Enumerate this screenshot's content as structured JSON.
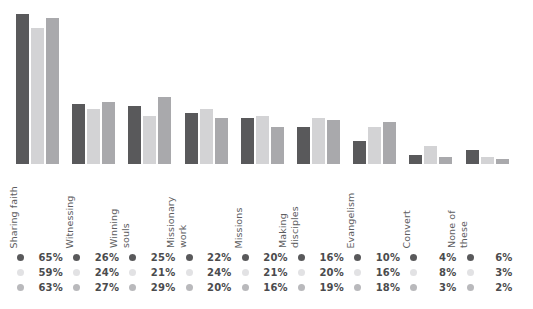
{
  "chart_data": {
    "type": "bar",
    "title": "",
    "subtitle": "",
    "xlabel": "",
    "ylabel": "",
    "grid": false,
    "legend_position": "bottom",
    "ylim": [
      0,
      70
    ],
    "value_suffix": "%",
    "orientation": "vertical",
    "grouping": "grouped",
    "categories": [
      "Sharing faith",
      "Witnessing",
      "Winning souls",
      "Missionary work",
      "Missions",
      "Making disciples",
      "Evangelism",
      "Convert",
      "None of these"
    ],
    "category_lines": [
      [
        "Sharing faith"
      ],
      [
        "Witnessing"
      ],
      [
        "Winning",
        "souls"
      ],
      [
        "Missionary",
        "work"
      ],
      [
        "Missions"
      ],
      [
        "Making",
        "disciples"
      ],
      [
        "Evangelism"
      ],
      [
        "Convert"
      ],
      [
        "None of",
        "these"
      ]
    ],
    "series": [
      {
        "name": "Series 1",
        "color": "#59595b",
        "values": [
          65,
          26,
          25,
          22,
          20,
          16,
          10,
          4,
          6
        ],
        "labels": [
          "65%",
          "26%",
          "25%",
          "22%",
          "20%",
          "16%",
          "10%",
          "4%",
          "6%"
        ]
      },
      {
        "name": "Series 2",
        "color": "#d3d3d5",
        "values": [
          59,
          24,
          21,
          24,
          21,
          20,
          16,
          8,
          3
        ],
        "labels": [
          "59%",
          "24%",
          "21%",
          "24%",
          "21%",
          "20%",
          "16%",
          "8%",
          "3%"
        ]
      },
      {
        "name": "Series 3",
        "color": "#a9a9ac",
        "values": [
          63,
          27,
          29,
          20,
          16,
          19,
          18,
          3,
          2
        ],
        "labels": [
          "63%",
          "27%",
          "29%",
          "20%",
          "16%",
          "19%",
          "18%",
          "3%",
          "2%"
        ]
      }
    ]
  },
  "colors": {
    "series_1": "#59595b",
    "series_2": "#d3d3d5",
    "series_3": "#a9a9ac",
    "dot_1": "#59595b",
    "dot_2": "#e2e2e4",
    "dot_3": "#b9b9bc",
    "background": "#ffffff",
    "label_text": "#5d5d5f",
    "value_text": "#4b4b4d"
  }
}
